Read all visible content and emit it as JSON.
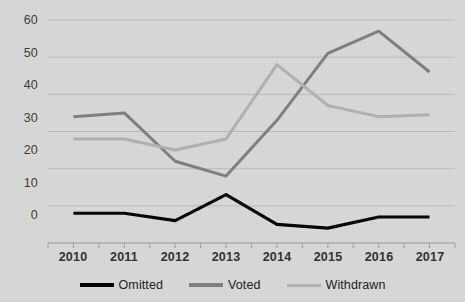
{
  "chart_data": {
    "type": "line",
    "title": "",
    "subtitle": "",
    "xlabel": "",
    "ylabel": "",
    "categories": [
      "2010",
      "2011",
      "2012",
      "2013",
      "2014",
      "2015",
      "2016",
      "2017"
    ],
    "ylim": [
      0,
      60
    ],
    "yticks": [
      0,
      10,
      20,
      30,
      40,
      50,
      60
    ],
    "grid": true,
    "legend_position": "bottom",
    "series": [
      {
        "name": "Omitted",
        "color": "#000000",
        "width": 3.2,
        "values": [
          8,
          8,
          6,
          13,
          5,
          4,
          7,
          7
        ]
      },
      {
        "name": "Voted",
        "color": "#7f7f7f",
        "width": 3.0,
        "values": [
          34,
          35,
          22,
          18,
          33,
          51,
          57,
          46
        ]
      },
      {
        "name": "Withdrawn",
        "color": "#b2b2b2",
        "width": 3.0,
        "values": [
          28,
          28,
          25,
          28,
          48,
          37,
          34,
          34.5
        ]
      }
    ]
  },
  "axis": {
    "y_tick_labels": [
      "60",
      "50",
      "40",
      "30",
      "20",
      "10",
      "0"
    ],
    "x_tick_labels": [
      "2010",
      "2011",
      "2012",
      "2013",
      "2014",
      "2015",
      "2016",
      "2017"
    ]
  },
  "legend": {
    "items": [
      {
        "label": "Omitted",
        "color": "#000000"
      },
      {
        "label": "Voted",
        "color": "#7f7f7f"
      },
      {
        "label": "Withdrawn",
        "color": "#b2b2b2"
      }
    ]
  },
  "colors": {
    "background": "#d9d9d7",
    "gridline": "#b9b9b7",
    "axis": "#9a9a98",
    "text": "#2e2e2e"
  }
}
